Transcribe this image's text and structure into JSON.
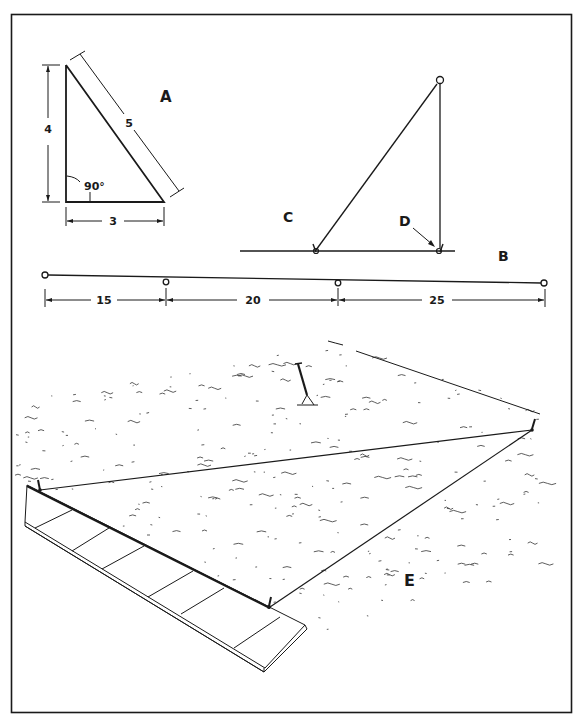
{
  "figure": {
    "panels": {
      "A": {
        "label": "A",
        "sides": {
          "vertical": "4",
          "horizontal": "3",
          "hypotenuse": "5"
        },
        "angle_label": "90°"
      },
      "B": {
        "label": "B",
        "stake_labels": {
          "left": "C",
          "right": "D"
        }
      },
      "measure_line": {
        "segments": [
          "15",
          "20",
          "25"
        ]
      },
      "E": {
        "label": "E"
      }
    },
    "colors": {
      "ink": "#1a1a1a",
      "paper": "#ffffff"
    }
  }
}
